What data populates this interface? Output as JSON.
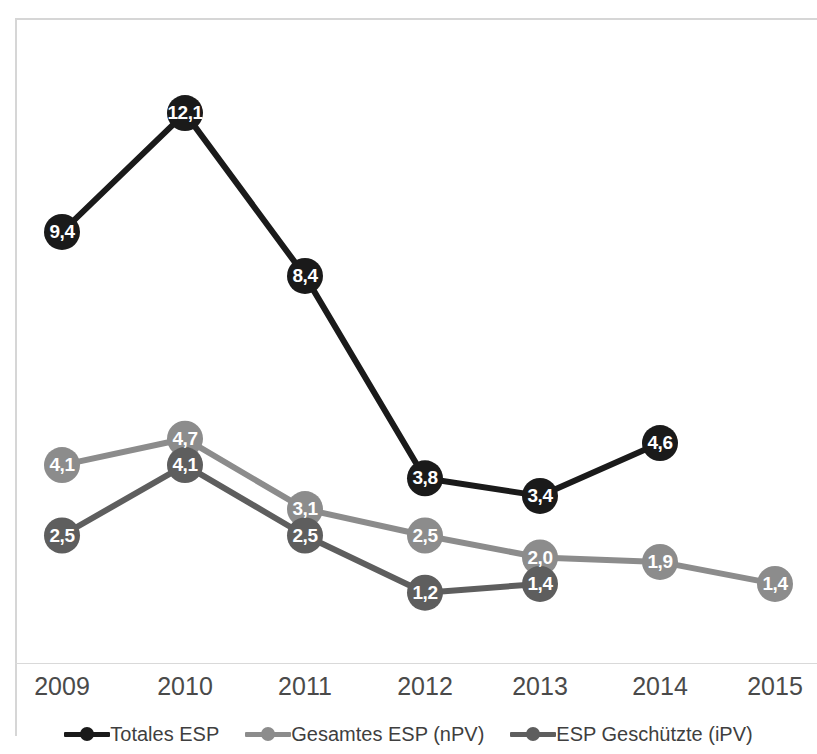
{
  "chart_data": {
    "type": "line",
    "title": "",
    "xlabel": "",
    "ylabel": "",
    "categories": [
      "2009",
      "2010",
      "2011",
      "2012",
      "2013",
      "2014",
      "2015"
    ],
    "ylim": [
      0,
      13
    ],
    "grid": false,
    "legend_position": "bottom",
    "series": [
      {
        "name": "Totales ESP",
        "color": "#1a1a1a",
        "values": [
          9.4,
          12.1,
          8.4,
          3.8,
          3.4,
          4.6,
          null
        ],
        "labels": [
          "9,4",
          "12,1",
          "8,4",
          "3,8",
          "3,4",
          "4,6",
          null
        ]
      },
      {
        "name": "Gesamtes ESP (nPV)",
        "color": "#8c8c8c",
        "values": [
          4.1,
          4.7,
          3.1,
          2.5,
          2.0,
          1.9,
          1.4
        ],
        "labels": [
          "4,1",
          "4,7",
          "3,1",
          "2,5",
          "2,0",
          "1,9",
          "1,4"
        ]
      },
      {
        "name": "ESP Geschützte (iPV)",
        "color": "#5e5e5e",
        "values": [
          2.5,
          4.1,
          2.5,
          1.2,
          1.4,
          null,
          null
        ],
        "labels": [
          "2,5",
          "4,1",
          "2,5",
          "1,2",
          "1,4",
          null,
          null
        ]
      }
    ]
  },
  "axis": {
    "tick_labels": [
      "2009",
      "2010",
      "2011",
      "2012",
      "2013",
      "2014",
      "2015"
    ]
  },
  "legend": {
    "items": [
      {
        "label": "Totales ESP",
        "color": "#1a1a1a",
        "marker": "line-dot-marker"
      },
      {
        "label": "Gesamtes ESP (nPV)",
        "color": "#8c8c8c",
        "marker": "line-dot-marker"
      },
      {
        "label": "ESP Geschützte (iPV)",
        "color": "#5e5e5e",
        "marker": "line-dot-marker"
      }
    ]
  }
}
